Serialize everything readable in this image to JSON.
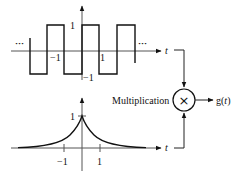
{
  "top_plot": {
    "name": "square-wave",
    "y_tick_pos": "1",
    "y_tick_neg": "−1",
    "x_tick_neg": "−1",
    "x_tick_pos": "1",
    "x_axis_label": "t",
    "ellipsis_left": "···",
    "ellipsis_right": "···"
  },
  "bottom_plot": {
    "name": "two-sided-exponential",
    "y_tick_peak": "1",
    "x_tick_neg": "−1",
    "x_tick_pos": "1",
    "x_axis_label": "t"
  },
  "multiplier": {
    "label": "Multiplication",
    "symbol": "×",
    "output_label": "g(t)",
    "output_prefix": "g(",
    "output_var": "t",
    "output_suffix": ")"
  }
}
